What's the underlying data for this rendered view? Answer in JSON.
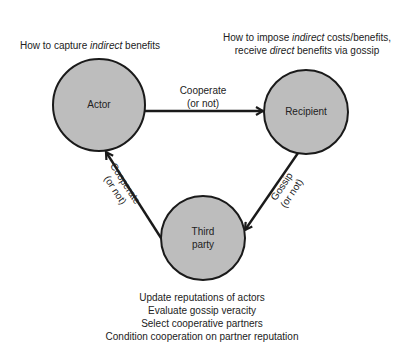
{
  "colors": {
    "node_fill": "#bdbdbd",
    "node_stroke": "#1a1a1a",
    "edge": "#1a1a1a",
    "text": "#222222",
    "background": "#ffffff"
  },
  "nodes": {
    "actor": {
      "label": "Actor"
    },
    "recipient": {
      "label": "Recipient"
    },
    "third_party": {
      "label_line1": "Third",
      "label_line2": "party"
    }
  },
  "edges": {
    "actor_to_recipient": {
      "line1": "Cooperate",
      "line2": "(or not)"
    },
    "recipient_to_third_party": {
      "line1": "Gossip",
      "line2": "(or not)"
    },
    "third_party_to_actor": {
      "line1": "Cooperate",
      "line2": "(or not)"
    }
  },
  "annotations": {
    "actor": {
      "pre": "How to capture ",
      "em": "indirect",
      "post": " benefits"
    },
    "recipient": {
      "line1_pre": "How to impose ",
      "line1_em": "indirect",
      "line1_post": " costs/benefits,",
      "line2_pre": "receive ",
      "line2_em": "direct",
      "line2_post": " benefits via gossip"
    },
    "third_party": [
      "Update reputations of actors",
      "Evaluate gossip veracity",
      "Select cooperative partners",
      "Condition cooperation on partner reputation"
    ]
  }
}
